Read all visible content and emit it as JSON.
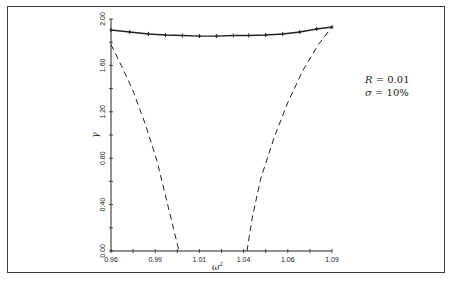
{
  "chart_data": {
    "type": "line",
    "title": "",
    "xlabel": "ω²",
    "ylabel": "γ",
    "xlim": [
      0.96,
      1.09
    ],
    "ylim": [
      0.0,
      2.0
    ],
    "x_ticks": [
      0.96,
      0.99,
      1.01,
      1.04,
      1.06,
      1.09
    ],
    "x_tick_labels": [
      "0.96",
      "0.99",
      "1.01",
      "1.04",
      "1.06",
      "1.09"
    ],
    "y_ticks": [
      0.0,
      0.4,
      0.8,
      1.2,
      1.6,
      2.0
    ],
    "y_tick_labels": [
      "0.00",
      "0.40",
      "0.80",
      "1.20",
      "1.60",
      "2.00"
    ],
    "grid": false,
    "annotations": [
      "R = 0.01",
      "σ = 10%"
    ],
    "series": [
      {
        "name": "solid-with-markers",
        "style": "solid",
        "markers": true,
        "x": [
          0.96,
          0.971,
          0.982,
          0.992,
          1.002,
          1.012,
          1.022,
          1.032,
          1.041,
          1.051,
          1.061,
          1.071,
          1.081,
          1.09
        ],
        "y": [
          1.905,
          1.888,
          1.871,
          1.862,
          1.858,
          1.853,
          1.853,
          1.858,
          1.858,
          1.862,
          1.871,
          1.888,
          1.914,
          1.931
        ]
      },
      {
        "name": "dashed-left",
        "style": "dashed",
        "markers": false,
        "x": [
          0.96,
          0.966,
          0.973,
          0.98,
          0.987,
          0.993,
          0.997,
          1.0
        ],
        "y": [
          1.78,
          1.6,
          1.38,
          1.1,
          0.78,
          0.42,
          0.18,
          0.0
        ]
      },
      {
        "name": "dashed-right",
        "style": "dashed",
        "markers": false,
        "x": [
          1.04,
          1.043,
          1.048,
          1.056,
          1.064,
          1.073,
          1.082,
          1.09
        ],
        "y": [
          0.0,
          0.28,
          0.62,
          0.98,
          1.28,
          1.56,
          1.78,
          1.931
        ]
      }
    ]
  },
  "legend": {
    "line1_var": "R",
    "line1_val": " = 0.01",
    "line2_var": "σ",
    "line2_val": " = 10%"
  },
  "axes": {
    "xlabel": "ω",
    "xlabel_sup": "2",
    "ylabel": "γ"
  }
}
